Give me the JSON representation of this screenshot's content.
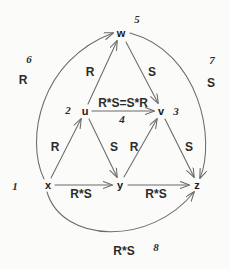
{
  "diagram": {
    "stroke_color": "#6b6b6b",
    "text_color": "#1a1a1a",
    "background": "#fbfbfa",
    "nodes": [
      {
        "id": "w",
        "label": "w",
        "x": 121,
        "y": 33
      },
      {
        "id": "u",
        "label": "u",
        "x": 85,
        "y": 111
      },
      {
        "id": "v",
        "label": "v",
        "x": 161,
        "y": 111
      },
      {
        "id": "x",
        "label": "x",
        "x": 48,
        "y": 185
      },
      {
        "id": "y",
        "label": "y",
        "x": 120,
        "y": 185
      },
      {
        "id": "z",
        "label": "z",
        "x": 197,
        "y": 185
      }
    ],
    "edge_labels": [
      {
        "id": "u-to-w",
        "text": "R",
        "x": 90,
        "y": 72
      },
      {
        "id": "w-to-v",
        "text": "S",
        "x": 152,
        "y": 72
      },
      {
        "id": "u-to-v",
        "text": "R*S=S*R",
        "x": 123,
        "y": 103
      },
      {
        "id": "x-to-u",
        "text": "R",
        "x": 55,
        "y": 147
      },
      {
        "id": "u-to-y",
        "text": "S",
        "x": 114,
        "y": 147
      },
      {
        "id": "y-to-v",
        "text": "R",
        "x": 134,
        "y": 147
      },
      {
        "id": "v-to-z",
        "text": "S",
        "x": 189,
        "y": 147
      },
      {
        "id": "x-to-y",
        "text": "R*S",
        "x": 81,
        "y": 194
      },
      {
        "id": "y-to-z",
        "text": "R*S",
        "x": 156,
        "y": 194
      },
      {
        "id": "outer-left",
        "text": "R",
        "x": 23,
        "y": 80
      },
      {
        "id": "outer-right",
        "text": "S",
        "x": 211,
        "y": 83
      },
      {
        "id": "outer-bottom",
        "text": "R*S",
        "x": 124,
        "y": 251
      }
    ],
    "index_labels": [
      {
        "id": "index-1",
        "text": "1",
        "x": 15,
        "y": 186
      },
      {
        "id": "index-2",
        "text": "2",
        "x": 68,
        "y": 110
      },
      {
        "id": "index-3",
        "text": "3",
        "x": 176,
        "y": 111
      },
      {
        "id": "index-4",
        "text": "4",
        "x": 122,
        "y": 119
      },
      {
        "id": "index-5",
        "text": "5",
        "x": 137,
        "y": 19
      },
      {
        "id": "index-6",
        "text": "6",
        "x": 29,
        "y": 59
      },
      {
        "id": "index-7",
        "text": "7",
        "x": 212,
        "y": 60
      },
      {
        "id": "index-8",
        "text": "8",
        "x": 156,
        "y": 247
      }
    ]
  }
}
